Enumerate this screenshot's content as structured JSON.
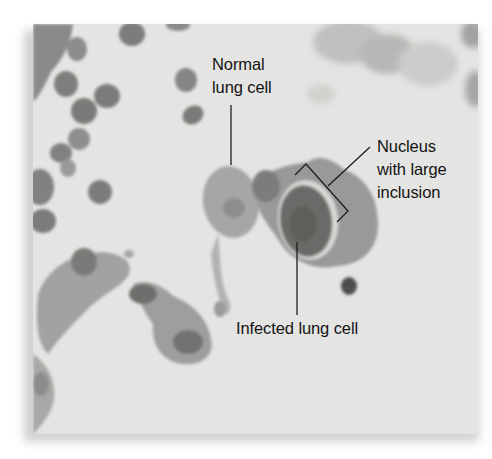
{
  "figure": {
    "type": "light micrograph",
    "colors": {
      "background": "#e6e6e4",
      "cell_light": "#a8a8a6",
      "cell_mid": "#8c8c8a",
      "cell_dark": "#5e5e5c",
      "label_text": "#141414",
      "leader_line": "#1e1e1e"
    }
  },
  "labels": {
    "normal": {
      "line1": "Normal",
      "line2": "lung cell"
    },
    "nucleus": {
      "line1": "Nucleus",
      "line2": "with large",
      "line3": "inclusion"
    },
    "infected": {
      "line1": "Infected lung cell"
    }
  }
}
